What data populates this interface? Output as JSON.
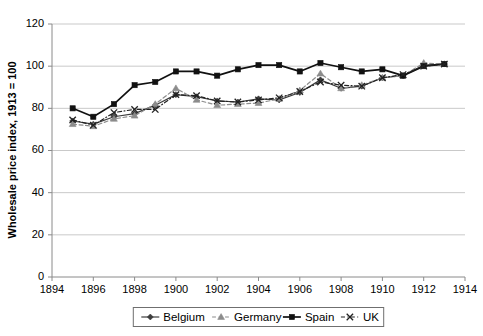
{
  "chart_data": {
    "type": "line",
    "title": "",
    "xlabel": "",
    "ylabel": "Wholesale price index, 1913 = 100",
    "xlim": [
      1894,
      1914
    ],
    "ylim": [
      0,
      120
    ],
    "grid": true,
    "legend_position": "bottom",
    "xticks": [
      1894,
      1896,
      1898,
      1900,
      1902,
      1904,
      1906,
      1908,
      1910,
      1912,
      1914
    ],
    "yticks": [
      0,
      20,
      40,
      60,
      80,
      100,
      120
    ],
    "x": [
      1895,
      1896,
      1897,
      1898,
      1899,
      1900,
      1901,
      1902,
      1903,
      1904,
      1905,
      1906,
      1907,
      1908,
      1909,
      1910,
      1911,
      1912,
      1913
    ],
    "series": [
      {
        "name": "Belgium",
        "marker": "diamond",
        "dash": "solid",
        "color": "#3d3d3d",
        "values": [
          74.0,
          72.5,
          76.0,
          77.5,
          81.5,
          86.5,
          85.5,
          83.5,
          83.0,
          84.5,
          84.0,
          87.5,
          93.5,
          89.5,
          90.5,
          94.5,
          95.5,
          100.5,
          101.0
        ]
      },
      {
        "name": "Germany",
        "marker": "triangle",
        "dash": "dashed",
        "color": "#8c8c8c",
        "values": [
          72.5,
          71.5,
          75.0,
          76.5,
          82.0,
          89.5,
          84.0,
          81.5,
          82.0,
          82.5,
          84.5,
          88.5,
          96.5,
          89.5,
          91.0,
          94.5,
          95.5,
          101.5,
          101.0
        ]
      },
      {
        "name": "Spain",
        "marker": "square",
        "dash": "solid",
        "color": "#111111",
        "values": [
          80.0,
          76.0,
          82.0,
          91.0,
          92.5,
          97.5,
          97.5,
          95.5,
          98.5,
          100.5,
          100.5,
          97.5,
          101.5,
          99.5,
          97.5,
          98.5,
          95.5,
          100.0,
          101.0
        ]
      },
      {
        "name": "UK",
        "marker": "cross",
        "dash": "dashdot",
        "color": "#222222",
        "values": [
          74.5,
          72.0,
          78.0,
          79.5,
          79.5,
          86.5,
          86.0,
          83.5,
          83.0,
          84.0,
          85.0,
          88.0,
          92.5,
          91.0,
          90.5,
          94.5,
          96.0,
          100.0,
          101.0
        ]
      }
    ]
  },
  "legend": {
    "items": [
      {
        "label": "Belgium"
      },
      {
        "label": "Germany"
      },
      {
        "label": "Spain"
      },
      {
        "label": "UK"
      }
    ]
  }
}
